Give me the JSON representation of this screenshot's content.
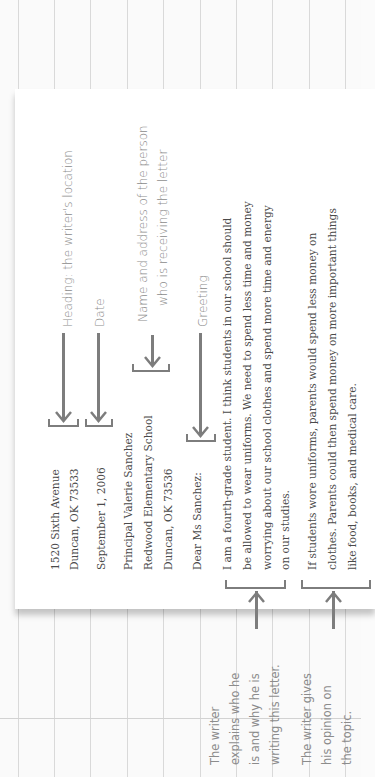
{
  "letter": {
    "heading": [
      "1520 Sixth Avenue",
      "Duncan, OK 73533"
    ],
    "date": "September 1, 2006",
    "inside_address": [
      "Principal Valerie Sanchez",
      "Redwood Elementary School",
      "Duncan, OK 73536"
    ],
    "greeting": "Dear Ms Sanchez:",
    "paragraph1": [
      "I am a fourth-grade student. I think students in our school should",
      "be allowed to wear uniforms. We need to spend less time and money",
      "worrying about our school clothes and spend more time and energy",
      "on our studies."
    ],
    "paragraph2": [
      "If students wore uniforms, parents would spend less money on",
      "clothes. Parents could then spend money on more important things",
      "like food, books, and medical care."
    ]
  },
  "annotations": {
    "heading": "Heading: the writer's location",
    "date": "Date",
    "inside_address": [
      "Name and address of the person",
      "who is receiving the letter"
    ],
    "greeting": "Greeting",
    "paragraph1": [
      "The writer",
      "explains who he",
      "is and why he is",
      "writing this letter."
    ],
    "paragraph2": [
      "The writer gives",
      "his opinion on",
      "the topic."
    ]
  },
  "colors": {
    "letter_text": "#4a4a4a",
    "annotation_text": "#8c8c8c",
    "arrow": "#7d7d7d",
    "grid": "#d9d9d9"
  }
}
